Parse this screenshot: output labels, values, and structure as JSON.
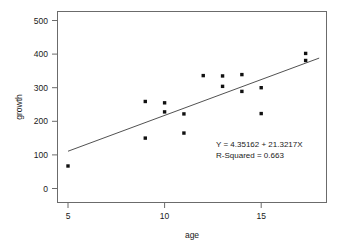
{
  "chart_data": {
    "type": "scatter",
    "title": "",
    "xlabel": "age",
    "ylabel": "growth",
    "xlim": [
      3.6,
      17.9
    ],
    "ylim": [
      -70,
      560
    ],
    "grid": false,
    "legend": "none",
    "xticks": [
      5,
      10,
      15
    ],
    "yticks": [
      0,
      100,
      200,
      300,
      400,
      500
    ],
    "xtick_labels": [
      "5",
      "10",
      "15"
    ],
    "ytick_labels": [
      "0",
      "100",
      "200",
      "300",
      "400",
      "500"
    ],
    "points": [
      {
        "x": 5,
        "y": 67
      },
      {
        "x": 9,
        "y": 259
      },
      {
        "x": 9,
        "y": 150
      },
      {
        "x": 10,
        "y": 255
      },
      {
        "x": 10,
        "y": 228
      },
      {
        "x": 11,
        "y": 222
      },
      {
        "x": 11,
        "y": 165
      },
      {
        "x": 12,
        "y": 336
      },
      {
        "x": 13,
        "y": 335
      },
      {
        "x": 13,
        "y": 304
      },
      {
        "x": 14,
        "y": 339
      },
      {
        "x": 14,
        "y": 289
      },
      {
        "x": 15,
        "y": 300
      },
      {
        "x": 15,
        "y": 223
      },
      {
        "x": 17.3,
        "y": 402
      },
      {
        "x": 17.3,
        "y": 381
      }
    ],
    "fit_line": {
      "intercept": 4.35162,
      "slope": 21.3217,
      "x_start": 5.0,
      "x_end": 18.0
    },
    "annotations": {
      "equation": "Y = 4.35162 + 21.3217X",
      "r_squared": "R-Squared = 0.663"
    }
  },
  "colors": {
    "point": "#111111",
    "line": "#3d3d3d",
    "frame": "#6b6b6b",
    "text": "#1a1a1a",
    "background": "#ffffff"
  }
}
